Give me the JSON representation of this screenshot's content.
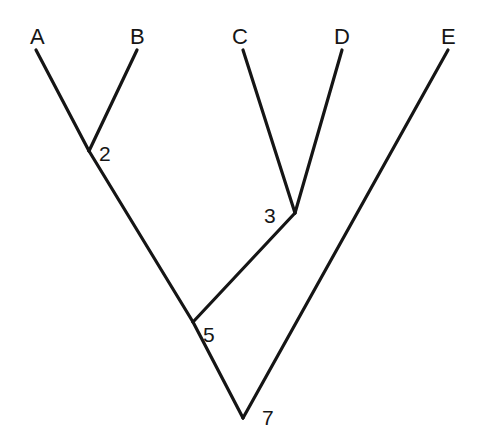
{
  "figure": {
    "background_color": "#ffffff",
    "line_color": "#151515",
    "text_color": "#161616",
    "width": 478,
    "height": 441
  },
  "chart_data": {
    "type": "diagram",
    "diagram_type": "cladogram",
    "title": "",
    "xlabel": "",
    "ylabel": "",
    "grid": false,
    "legend": false,
    "tips": [
      {
        "label": "A",
        "x": 36,
        "y": 50,
        "label_x": 30,
        "label_y": 44
      },
      {
        "label": "B",
        "x": 137,
        "y": 50,
        "label_x": 130,
        "label_y": 44
      },
      {
        "label": "C",
        "x": 243,
        "y": 50,
        "label_x": 232,
        "label_y": 44
      },
      {
        "label": "D",
        "x": 342,
        "y": 50,
        "label_x": 334,
        "label_y": 44
      },
      {
        "label": "E",
        "x": 448,
        "y": 50,
        "label_x": 441,
        "label_y": 44
      }
    ],
    "nodes": [
      {
        "label": "2",
        "x": 89,
        "y": 151,
        "label_x": 99,
        "label_y": 161
      },
      {
        "label": "3",
        "x": 295,
        "y": 213,
        "label_x": 264,
        "label_y": 223
      },
      {
        "label": "5",
        "x": 193,
        "y": 322,
        "label_x": 203,
        "label_y": 342
      },
      {
        "label": "7",
        "x": 243,
        "y": 418,
        "label_x": 262,
        "label_y": 425
      }
    ],
    "edges": [
      {
        "name": "branch-A-to-2",
        "from": "A",
        "to": "2",
        "x1": 36,
        "y1": 50,
        "x2": 89,
        "y2": 151
      },
      {
        "name": "branch-B-to-2",
        "from": "B",
        "to": "2",
        "x1": 137,
        "y1": 50,
        "x2": 89,
        "y2": 151
      },
      {
        "name": "branch-2-to-5",
        "from": "2",
        "to": "5",
        "x1": 89,
        "y1": 151,
        "x2": 193,
        "y2": 322
      },
      {
        "name": "branch-C-to-3",
        "from": "C",
        "to": "3",
        "x1": 243,
        "y1": 50,
        "x2": 295,
        "y2": 213
      },
      {
        "name": "branch-D-to-3",
        "from": "D",
        "to": "3",
        "x1": 342,
        "y1": 50,
        "x2": 295,
        "y2": 213
      },
      {
        "name": "branch-3-to-5",
        "from": "3",
        "to": "5",
        "x1": 295,
        "y1": 213,
        "x2": 193,
        "y2": 322
      },
      {
        "name": "branch-5-to-7",
        "from": "5",
        "to": "7",
        "x1": 193,
        "y1": 322,
        "x2": 243,
        "y2": 418
      },
      {
        "name": "branch-E-to-7",
        "from": "E",
        "to": "7",
        "x1": 448,
        "y1": 50,
        "x2": 243,
        "y2": 418
      }
    ]
  }
}
